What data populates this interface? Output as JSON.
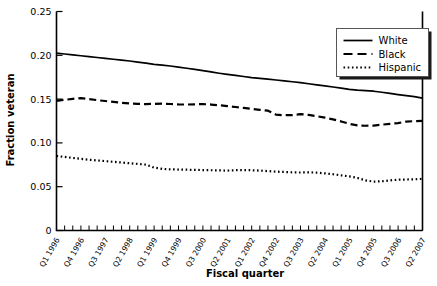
{
  "chart_data": {
    "type": "line",
    "title": "",
    "xlabel": "Fiscal quarter",
    "ylabel": "Fraction veteran",
    "ylim": [
      0,
      0.25
    ],
    "ytick_labels": [
      "0",
      "0.05",
      "0.10",
      "0.15",
      "0.20",
      "0.25"
    ],
    "ytick_values": [
      0,
      0.05,
      0.1,
      0.15,
      0.2,
      0.25
    ],
    "grid": false,
    "legend_position": "top-right",
    "x_label_interval": 3,
    "categories": [
      "Q1 1996",
      "Q2 1996",
      "Q3 1996",
      "Q4 1996",
      "Q1 1997",
      "Q2 1997",
      "Q3 1997",
      "Q4 1997",
      "Q1 1998",
      "Q2 1998",
      "Q3 1998",
      "Q4 1998",
      "Q1 1999",
      "Q2 1999",
      "Q3 1999",
      "Q4 1999",
      "Q1 2000",
      "Q2 2000",
      "Q3 2000",
      "Q4 2000",
      "Q1 2001",
      "Q2 2001",
      "Q3 2001",
      "Q4 2001",
      "Q1 2002",
      "Q2 2002",
      "Q3 2002",
      "Q4 2002",
      "Q1 2003",
      "Q2 2003",
      "Q3 2003",
      "Q4 2003",
      "Q1 2004",
      "Q2 2004",
      "Q3 2004",
      "Q4 2004",
      "Q1 2005",
      "Q2 2005",
      "Q3 2005",
      "Q4 2005",
      "Q1 2006",
      "Q2 2006",
      "Q3 2006",
      "Q4 2006",
      "Q1 2007",
      "Q2 2007"
    ],
    "tick_labels_shown": [
      "Q1 1996",
      "Q4 1996",
      "Q3 1997",
      "Q2 1998",
      "Q1 1999",
      "Q4 1999",
      "Q3 2000",
      "Q2 2001",
      "Q1 2002",
      "Q4 2002",
      "Q3 2003",
      "Q2 2004",
      "Q1 2005",
      "Q4 2005",
      "Q3 2006",
      "Q2 2007"
    ],
    "series": [
      {
        "name": "White",
        "style": "solid",
        "values": [
          0.2025,
          0.2015,
          0.2005,
          0.1995,
          0.1985,
          0.1975,
          0.1965,
          0.1955,
          0.1945,
          0.1935,
          0.1922,
          0.191,
          0.1897,
          0.1888,
          0.1878,
          0.1866,
          0.1852,
          0.184,
          0.1826,
          0.181,
          0.1795,
          0.1782,
          0.177,
          0.1758,
          0.1745,
          0.1736,
          0.1728,
          0.1718,
          0.1708,
          0.1698,
          0.1688,
          0.1675,
          0.1662,
          0.165,
          0.1638,
          0.1625,
          0.1612,
          0.1602,
          0.1596,
          0.159,
          0.1578,
          0.1566,
          0.1552,
          0.154,
          0.1528,
          0.1512
        ]
      },
      {
        "name": "Black",
        "style": "dashed",
        "values": [
          0.148,
          0.1492,
          0.1503,
          0.1512,
          0.15,
          0.1488,
          0.1478,
          0.1468,
          0.1458,
          0.145,
          0.1446,
          0.1443,
          0.1446,
          0.1448,
          0.1444,
          0.144,
          0.1438,
          0.144,
          0.1443,
          0.1438,
          0.143,
          0.142,
          0.141,
          0.14,
          0.1388,
          0.1378,
          0.1368,
          0.1322,
          0.1316,
          0.1318,
          0.1328,
          0.132,
          0.1305,
          0.1288,
          0.1268,
          0.1245,
          0.1218,
          0.12,
          0.1196,
          0.1198,
          0.1208,
          0.1218,
          0.1226,
          0.1244,
          0.1248,
          0.1252
        ]
      },
      {
        "name": "Hispanic",
        "style": "dotted",
        "values": [
          0.085,
          0.084,
          0.0828,
          0.0818,
          0.0808,
          0.08,
          0.0792,
          0.0784,
          0.0776,
          0.0768,
          0.076,
          0.0752,
          0.0718,
          0.0704,
          0.0698,
          0.0696,
          0.0694,
          0.0692,
          0.069,
          0.0688,
          0.0686,
          0.0684,
          0.0688,
          0.069,
          0.0688,
          0.0684,
          0.0678,
          0.0672,
          0.0668,
          0.0664,
          0.0662,
          0.0664,
          0.066,
          0.0652,
          0.0642,
          0.063,
          0.0618,
          0.06,
          0.0572,
          0.0558,
          0.0562,
          0.0572,
          0.058,
          0.0582,
          0.0584,
          0.059
        ]
      }
    ]
  },
  "legend": {
    "entries": [
      {
        "label": "White"
      },
      {
        "label": "Black"
      },
      {
        "label": "Hispanic"
      }
    ]
  }
}
